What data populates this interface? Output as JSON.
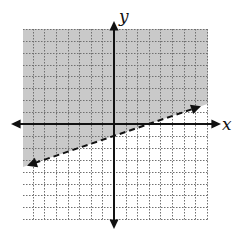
{
  "chart_data": {
    "type": "inequality-graph",
    "title": "",
    "xlabel": "x",
    "ylabel": "y",
    "xlim": [
      -8,
      8
    ],
    "ylim": [
      -8,
      8
    ],
    "grid": true,
    "grid_step": 1,
    "tick_labels": false,
    "boundary_line": {
      "equation": "y = (1/3)x - 1",
      "slope": 0.3333,
      "y_intercept": -1,
      "x_intercept": 3,
      "style": "dashed",
      "arrow_ends": true,
      "x_start": -7.5,
      "x_end": 7.5
    },
    "inequality": "y > (1/3)x - 1",
    "shaded_region": "above",
    "legend": null
  },
  "layout": {
    "origin_px": [
      114,
      124
    ],
    "unit_px_x": 11.6,
    "unit_px_y": 11.9,
    "grid_left_px": 23,
    "grid_right_px": 208,
    "grid_top_px": 29,
    "grid_bottom_px": 220,
    "x_axis_start_px": 11,
    "x_axis_end_px": 221,
    "y_axis_start_px": 21,
    "y_axis_end_px": 229,
    "x_label_pos_px": [
      228,
      128
    ],
    "y_label_pos_px": [
      123,
      22
    ]
  },
  "colors": {
    "shade": "#c9c9c9",
    "grid": "#707070",
    "axis": "#111111",
    "boundary": "#111111",
    "background": "#ffffff"
  }
}
